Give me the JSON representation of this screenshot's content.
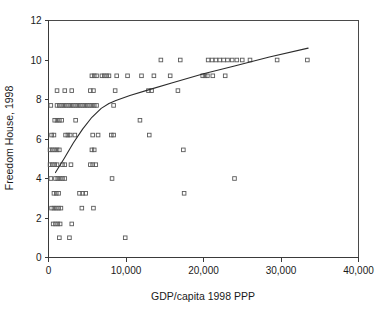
{
  "chart_data": {
    "type": "scatter",
    "title": "",
    "xlabel": "GDP/capita 1998 PPP",
    "ylabel": "Freedom House, 1998",
    "xlim": [
      0,
      40000
    ],
    "ylim": [
      0,
      12
    ],
    "xticks": [
      0,
      10000,
      20000,
      30000,
      40000
    ],
    "xticklabels": [
      "0",
      "10,000",
      "20,000",
      "30,000",
      "40,000"
    ],
    "yticks": [
      0,
      2,
      4,
      6,
      8,
      10,
      12
    ],
    "yticklabels": [
      "0",
      "2",
      "4",
      "6",
      "8",
      "10",
      "12"
    ],
    "grid": false,
    "legend": null,
    "marker": "open-square",
    "marker_color": "#5a5a5a",
    "points": [
      [
        14500,
        10.0
      ],
      [
        17000,
        10.0
      ],
      [
        20600,
        10.0
      ],
      [
        21100,
        10.0
      ],
      [
        21600,
        10.0
      ],
      [
        22100,
        10.0
      ],
      [
        22600,
        10.0
      ],
      [
        23100,
        10.0
      ],
      [
        23700,
        10.0
      ],
      [
        24300,
        10.0
      ],
      [
        25000,
        10.0
      ],
      [
        26000,
        10.0
      ],
      [
        29500,
        10.0
      ],
      [
        33400,
        10.0
      ],
      [
        5600,
        9.2
      ],
      [
        5900,
        9.2
      ],
      [
        6200,
        9.2
      ],
      [
        6900,
        9.2
      ],
      [
        7200,
        9.2
      ],
      [
        7500,
        9.2
      ],
      [
        7800,
        9.2
      ],
      [
        8800,
        9.2
      ],
      [
        10200,
        9.2
      ],
      [
        12000,
        9.2
      ],
      [
        13600,
        9.2
      ],
      [
        15700,
        9.2
      ],
      [
        19900,
        9.2
      ],
      [
        20200,
        9.2
      ],
      [
        20500,
        9.2
      ],
      [
        21200,
        9.2
      ],
      [
        22800,
        9.2
      ],
      [
        1100,
        8.45
      ],
      [
        2100,
        8.45
      ],
      [
        3000,
        8.45
      ],
      [
        5400,
        8.45
      ],
      [
        5800,
        8.45
      ],
      [
        8600,
        8.45
      ],
      [
        12900,
        8.45
      ],
      [
        13300,
        8.45
      ],
      [
        16700,
        8.45
      ],
      [
        300,
        7.7
      ],
      [
        1100,
        7.7
      ],
      [
        1400,
        7.7
      ],
      [
        1700,
        7.7
      ],
      [
        2000,
        7.7
      ],
      [
        2300,
        7.7
      ],
      [
        2600,
        7.7
      ],
      [
        2900,
        7.7
      ],
      [
        3200,
        7.7
      ],
      [
        3500,
        7.7
      ],
      [
        3800,
        7.7
      ],
      [
        4100,
        7.7
      ],
      [
        4400,
        7.7
      ],
      [
        4700,
        7.7
      ],
      [
        5000,
        7.7
      ],
      [
        5300,
        7.7
      ],
      [
        5600,
        7.7
      ],
      [
        5900,
        7.7
      ],
      [
        6200,
        7.7
      ],
      [
        8400,
        7.7
      ],
      [
        800,
        6.95
      ],
      [
        1100,
        6.95
      ],
      [
        1400,
        6.95
      ],
      [
        1700,
        6.95
      ],
      [
        3500,
        6.95
      ],
      [
        11800,
        6.95
      ],
      [
        400,
        6.2
      ],
      [
        700,
        6.2
      ],
      [
        2200,
        6.2
      ],
      [
        2500,
        6.2
      ],
      [
        2800,
        6.2
      ],
      [
        3400,
        6.2
      ],
      [
        5700,
        6.2
      ],
      [
        6400,
        6.2
      ],
      [
        8100,
        6.2
      ],
      [
        8400,
        6.2
      ],
      [
        13000,
        6.2
      ],
      [
        200,
        5.45
      ],
      [
        500,
        5.45
      ],
      [
        800,
        5.45
      ],
      [
        1100,
        5.45
      ],
      [
        1400,
        5.45
      ],
      [
        5600,
        5.45
      ],
      [
        5900,
        5.45
      ],
      [
        17400,
        5.45
      ],
      [
        200,
        4.7
      ],
      [
        500,
        4.7
      ],
      [
        800,
        4.7
      ],
      [
        1100,
        4.7
      ],
      [
        1800,
        4.7
      ],
      [
        2100,
        4.7
      ],
      [
        2900,
        4.7
      ],
      [
        5400,
        4.7
      ],
      [
        5700,
        4.7
      ],
      [
        6100,
        4.7
      ],
      [
        300,
        4.0
      ],
      [
        900,
        4.0
      ],
      [
        1200,
        4.0
      ],
      [
        1500,
        4.0
      ],
      [
        1800,
        4.0
      ],
      [
        2100,
        4.0
      ],
      [
        8200,
        4.0
      ],
      [
        24000,
        4.0
      ],
      [
        700,
        3.25
      ],
      [
        1000,
        3.25
      ],
      [
        1300,
        3.25
      ],
      [
        4000,
        3.25
      ],
      [
        4400,
        3.25
      ],
      [
        4800,
        3.25
      ],
      [
        17500,
        3.25
      ],
      [
        400,
        2.5
      ],
      [
        700,
        2.5
      ],
      [
        1000,
        2.5
      ],
      [
        1300,
        2.5
      ],
      [
        1600,
        2.5
      ],
      [
        4300,
        2.5
      ],
      [
        5800,
        2.5
      ],
      [
        600,
        1.7
      ],
      [
        900,
        1.7
      ],
      [
        1200,
        1.7
      ],
      [
        1500,
        1.7
      ],
      [
        3000,
        1.7
      ],
      [
        1400,
        1.0
      ],
      [
        2700,
        1.0
      ],
      [
        9900,
        1.0
      ]
    ],
    "trend_line": {
      "style": "fitted-curve",
      "color": "#2b2b2b",
      "points": [
        [
          900,
          4.3
        ],
        [
          2000,
          5.0
        ],
        [
          3200,
          5.8
        ],
        [
          4400,
          6.5
        ],
        [
          5600,
          7.1
        ],
        [
          6800,
          7.55
        ],
        [
          7800,
          7.8
        ],
        [
          8700,
          7.95
        ],
        [
          10500,
          8.2
        ],
        [
          13000,
          8.5
        ],
        [
          16000,
          8.85
        ],
        [
          20000,
          9.3
        ],
        [
          24000,
          9.7
        ],
        [
          28500,
          10.15
        ],
        [
          33500,
          10.6
        ]
      ]
    }
  }
}
